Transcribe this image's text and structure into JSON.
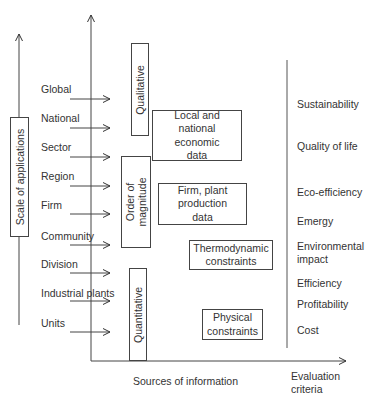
{
  "diagram": {
    "left_axis_label": "Scale of applications",
    "x_axis_label": "Sources of information",
    "right_axis_label": "Evaluation\ncriteria",
    "scales": [
      {
        "label": "Global",
        "y": 90
      },
      {
        "label": "National",
        "y": 119
      },
      {
        "label": "Sector",
        "y": 148
      },
      {
        "label": "Region",
        "y": 177
      },
      {
        "label": "Firm",
        "y": 206
      },
      {
        "label": "Community",
        "y": 236
      },
      {
        "label": "Division",
        "y": 264
      },
      {
        "label": "Industrial plants",
        "y": 293
      },
      {
        "label": "Units",
        "y": 323
      }
    ],
    "vertical_boxes": [
      {
        "label": "Qualitative"
      },
      {
        "label": "Order of\nmagnitude"
      },
      {
        "label": "Quantitative"
      }
    ],
    "source_boxes": [
      {
        "label": "Local and\nnational\neconomic\ndata"
      },
      {
        "label": "Firm, plant\nproduction\ndata"
      },
      {
        "label": "Thermodynamic\nconstraints"
      },
      {
        "label": "Physical\nconstraints"
      }
    ],
    "criteria": [
      {
        "label": "Sustainability",
        "y": 98
      },
      {
        "label": "Quality of life",
        "y": 140
      },
      {
        "label": "Eco-efficiency",
        "y": 186
      },
      {
        "label": "Emergy",
        "y": 215
      },
      {
        "label": "Environmental\nimpact",
        "y": 240
      },
      {
        "label": "Efficiency",
        "y": 277
      },
      {
        "label": "Profitability",
        "y": 298
      },
      {
        "label": "Cost",
        "y": 324
      }
    ]
  }
}
